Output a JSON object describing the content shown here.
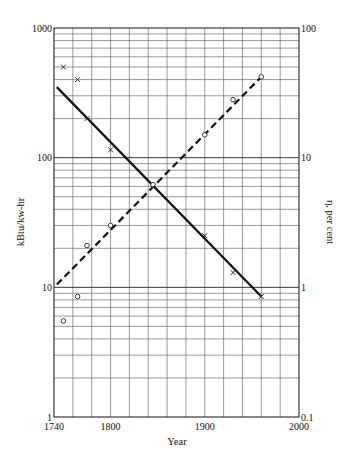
{
  "chart_data": {
    "type": "line",
    "title": "",
    "xlabel": "Year",
    "ylabel": "kBtu/kw-hr",
    "y2label": "η, per cent",
    "xlim": [
      1740,
      2000
    ],
    "ylim": [
      1,
      1000
    ],
    "y2lim": [
      0.1,
      100
    ],
    "yscale": "log",
    "grid": true,
    "x_ticks": [
      {
        "value": 1740,
        "label": "1740"
      },
      {
        "value": 1800,
        "label": "1800"
      },
      {
        "value": 1900,
        "label": "1900"
      },
      {
        "value": 2000,
        "label": "2000"
      }
    ],
    "y_ticks": [
      {
        "value": 1,
        "label": "1"
      },
      {
        "value": 10,
        "label": "10"
      },
      {
        "value": 100,
        "label": "100"
      },
      {
        "value": 1000,
        "label": "1000"
      }
    ],
    "y2_ticks": [
      {
        "value": 0.1,
        "label": "0.1"
      },
      {
        "value": 1,
        "label": "1"
      },
      {
        "value": 10,
        "label": "10"
      },
      {
        "value": 100,
        "label": "100"
      }
    ],
    "series": [
      {
        "name": "Heat rate (kBtu/kw-hr)",
        "axis": "left",
        "marker": "x",
        "line_style": "solid",
        "points": [
          {
            "x": 1750,
            "y": 500
          },
          {
            "x": 1765,
            "y": 400
          },
          {
            "x": 1775,
            "y": 200
          },
          {
            "x": 1800,
            "y": 115
          },
          {
            "x": 1845,
            "y": 60
          },
          {
            "x": 1900,
            "y": 25
          },
          {
            "x": 1930,
            "y": 13
          },
          {
            "x": 1960,
            "y": 8.5
          }
        ],
        "fit_line": [
          {
            "x": 1743,
            "y": 350
          },
          {
            "x": 1960,
            "y": 8.5
          }
        ]
      },
      {
        "name": "Efficiency η (per cent)",
        "axis": "right",
        "marker": "o",
        "line_style": "dashed",
        "points": [
          {
            "x": 1750,
            "y": 0.55
          },
          {
            "x": 1765,
            "y": 0.85
          },
          {
            "x": 1775,
            "y": 2.1
          },
          {
            "x": 1800,
            "y": 3.0
          },
          {
            "x": 1845,
            "y": 6.2
          },
          {
            "x": 1900,
            "y": 15
          },
          {
            "x": 1930,
            "y": 28
          },
          {
            "x": 1960,
            "y": 42
          }
        ],
        "fit_line": [
          {
            "x": 1743,
            "y": 1.05
          },
          {
            "x": 1960,
            "y": 42
          }
        ]
      }
    ]
  }
}
